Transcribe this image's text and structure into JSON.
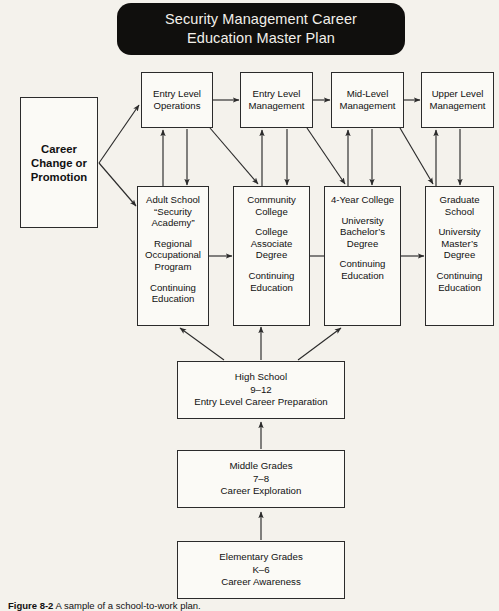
{
  "banner": {
    "title": "Security Management Career\nEducation Master Plan",
    "bg_color": "#100f0d",
    "text_color": "#f2f0ea"
  },
  "page": {
    "background_color": "#f4f2ec",
    "box_fill": "#fbfaf6",
    "line_color": "#2b2b2b"
  },
  "nodes": {
    "career": {
      "label": "Career\nChange or\nPromotion"
    },
    "entry_level_operations": {
      "label": "Entry Level\nOperations"
    },
    "entry_level_management": {
      "label": "Entry Level\nManagement"
    },
    "mid_level_management": {
      "label": "Mid-Level\nManagement"
    },
    "upper_level_management": {
      "label": "Upper Level\nManagement"
    },
    "adult_school": {
      "line1": "Adult School\n“Security\nAcademy”",
      "line2": "Regional\nOccupational\nProgram",
      "line3": "Continuing\nEducation"
    },
    "community_college": {
      "line1": "Community\nCollege",
      "line2": "College\nAssociate\nDegree",
      "line3": "Continuing\nEducation"
    },
    "four_year_college": {
      "line1": "4-Year College",
      "line2": "University\nBachelor’s\nDegree",
      "line3": "Continuing\nEducation"
    },
    "graduate_school": {
      "line1": "Graduate\nSchool",
      "line2": "University\nMaster’s\nDegree",
      "line3": "Continuing\nEducation"
    },
    "high_school": {
      "label": "High School\n9–12\nEntry Level Career Preparation"
    },
    "middle_grades": {
      "label": "Middle Grades\n7–8\nCareer Exploration"
    },
    "elementary_grades": {
      "label": "Elementary Grades\nK–6\nCareer Awareness"
    }
  },
  "caption": {
    "figure_label": "Figure 8-2",
    "text": "A sample of a school-to-work plan."
  }
}
